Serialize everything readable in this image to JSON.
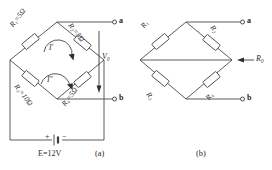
{
  "figure": {
    "type": "circuit-diagram",
    "line_color": "#4a4a4a",
    "text_color": "#2b2b2b",
    "background": "#ffffff"
  },
  "panel_a": {
    "caption": "(a)",
    "resistors": [
      {
        "id": "r1",
        "name": "R",
        "sub": "1",
        "value": "5Ω",
        "label": "R₁=5Ω",
        "position": "top-left"
      },
      {
        "id": "r2",
        "name": "R",
        "sub": "2",
        "value": "5Ω",
        "label": "R₂=5Ω",
        "position": "top-right"
      },
      {
        "id": "r3",
        "name": "R",
        "sub": "3",
        "value": "10Ω",
        "label": "R₃=10Ω",
        "position": "bottom-left"
      },
      {
        "id": "r4",
        "name": "R",
        "sub": "4",
        "value": "5Ω",
        "label": "R₄=5Ω",
        "position": "bottom-right"
      }
    ],
    "terminals": [
      {
        "id": "a",
        "label": "a",
        "position": "top-right"
      },
      {
        "id": "b",
        "label": "b",
        "position": "bottom-right"
      }
    ],
    "voltage": {
      "name": "V",
      "sub": "0",
      "label": "V₀",
      "arrow": "down"
    },
    "source": {
      "label": "E=12V",
      "symbol": "E",
      "value": "12V",
      "plus": "+",
      "minus": "−"
    },
    "mesh_currents": [
      {
        "id": "i-prime",
        "label": "I′",
        "direction": "clockwise"
      },
      {
        "id": "i-dprime",
        "label": "I″",
        "direction": "clockwise"
      }
    ]
  },
  "panel_b": {
    "caption": "(b)",
    "resistors": [
      {
        "id": "r1",
        "name": "R",
        "sub": "1",
        "label": "R₁",
        "position": "top-left"
      },
      {
        "id": "r2",
        "name": "R",
        "sub": "2",
        "label": "R₂",
        "position": "top-right"
      },
      {
        "id": "r3",
        "name": "R",
        "sub": "3",
        "label": "R₃",
        "position": "bottom-left"
      },
      {
        "id": "r4",
        "name": "R",
        "sub": "4",
        "label": "R₄",
        "position": "bottom-right"
      }
    ],
    "terminals": [
      {
        "id": "a",
        "label": "a",
        "position": "top-right"
      },
      {
        "id": "b",
        "label": "b",
        "position": "bottom-right"
      }
    ],
    "equivalent": {
      "name": "R",
      "sub": "0",
      "label": "R₀",
      "arrow": "left"
    }
  }
}
